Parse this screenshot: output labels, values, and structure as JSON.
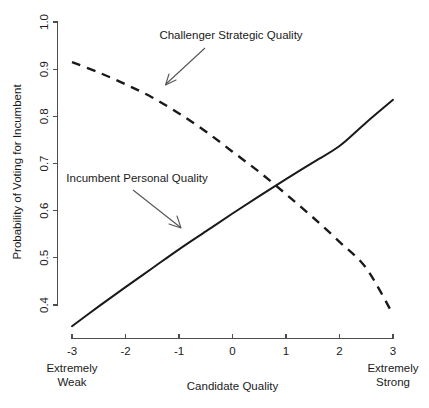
{
  "chart_data": {
    "type": "line",
    "title": "",
    "xlabel": "Candidate Quality",
    "ylabel": "Probability of Voting for Incumbent",
    "xlim": [
      -3,
      3
    ],
    "ylim": [
      0.4,
      1.0
    ],
    "grid": false,
    "legend_position": "inline-annotations",
    "xticks": [
      "-3",
      "-2",
      "-1",
      "0",
      "1",
      "2",
      "3"
    ],
    "xtick_values": [
      -3,
      -2,
      -1,
      0,
      1,
      2,
      3
    ],
    "yticks": [
      "0.4",
      "0.5",
      "0.6",
      "0.7",
      "0.8",
      "0.9",
      "1.0"
    ],
    "ytick_values": [
      0.4,
      0.5,
      0.6,
      0.7,
      0.8,
      0.9,
      1.0
    ],
    "x_axis_low_endcap": "Extremely\nWeak",
    "x_axis_low_endcap_line1": "Extremely",
    "x_axis_low_endcap_line2": "Weak",
    "x_axis_high_endcap_line1": "Extremely",
    "x_axis_high_endcap_line2": "Strong",
    "series": [
      {
        "name": "Incumbent Personal Quality",
        "style": "solid",
        "color": "#1a1a1a",
        "x": [
          -3,
          -2.5,
          -2,
          -1.5,
          -1,
          -0.5,
          0,
          0.5,
          1,
          1.5,
          2,
          2.5,
          3
        ],
        "values": [
          0.355,
          0.397,
          0.438,
          0.478,
          0.518,
          0.556,
          0.594,
          0.631,
          0.667,
          0.702,
          0.737,
          0.787,
          0.835
        ]
      },
      {
        "name": "Challenger Strategic Quality",
        "style": "dashed",
        "color": "#1a1a1a",
        "x": [
          -3,
          -2.5,
          -2,
          -1.5,
          -1,
          -0.5,
          0,
          0.5,
          1,
          1.5,
          2,
          2.5,
          3
        ],
        "values": [
          0.915,
          0.893,
          0.868,
          0.84,
          0.806,
          0.768,
          0.725,
          0.682,
          0.635,
          0.586,
          0.534,
          0.478,
          0.38
        ]
      }
    ],
    "annotations": [
      {
        "label": "Challenger Strategic Quality",
        "target_series": "Challenger Strategic Quality",
        "label_x": -0.05,
        "label_y": 0.963
      },
      {
        "label": "Incumbent Personal Quality",
        "target_series": "Incumbent Personal Quality",
        "label_x": -2.7,
        "label_y": 0.633
      }
    ],
    "crossing_point": {
      "x": 0.6,
      "y": 0.675
    }
  }
}
